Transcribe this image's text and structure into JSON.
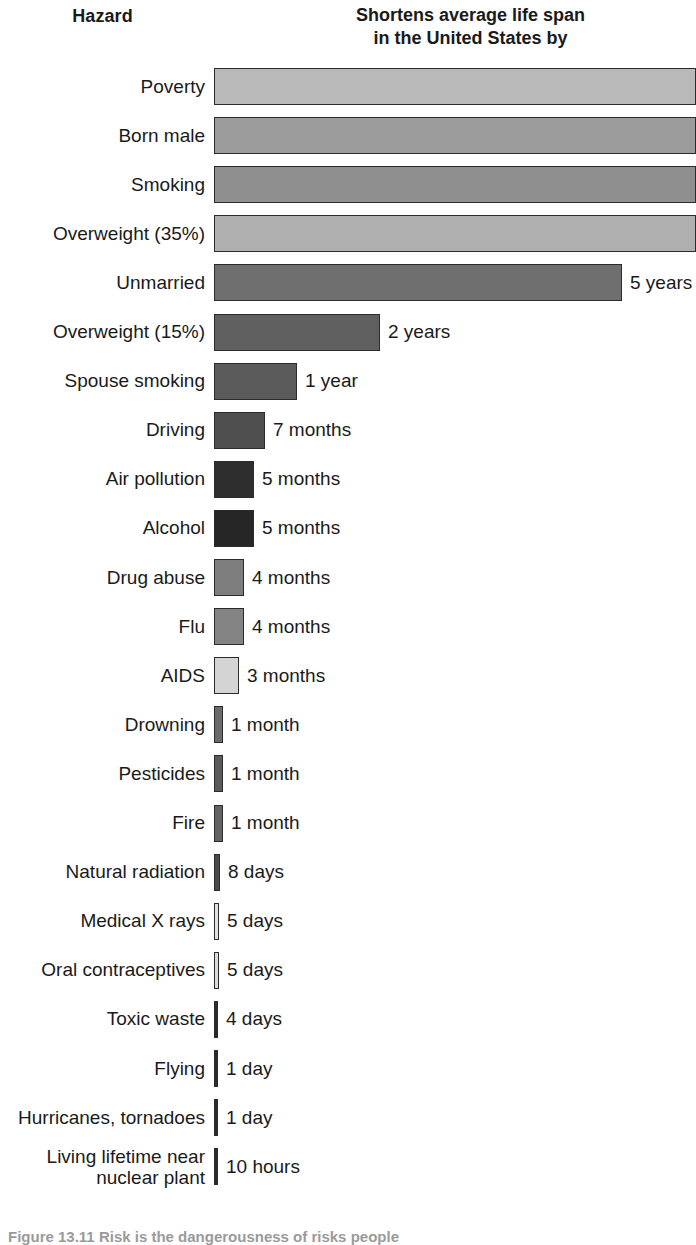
{
  "header": {
    "left_title": "Hazard",
    "right_title_line1": "Shortens average life span",
    "right_title_line2": "in the United States by"
  },
  "caption": "Figure 13.11  Risk is the dangerousness of risks people",
  "chart_data": {
    "type": "bar",
    "title": "Shortens average life span in the United States by",
    "xlabel": "",
    "ylabel": "Hazard",
    "orientation": "horizontal",
    "grid": false,
    "legend": "none",
    "note": "Top four bars extend past the right edge of the image (values not labeled).",
    "categories": [
      "Poverty",
      "Born male",
      "Smoking",
      "Overweight (35%)",
      "Unmarried",
      "Overweight (15%)",
      "Spouse smoking",
      "Driving",
      "Air pollution",
      "Alcohol",
      "Drug abuse",
      "Flu",
      "AIDS",
      "Drowning",
      "Pesticides",
      "Fire",
      "Natural radiation",
      "Medical X rays",
      "Oral contraceptives",
      "Toxic waste",
      "Flying",
      "Hurricanes, tornadoes",
      "Living lifetime near nuclear plant"
    ],
    "value_labels": [
      "",
      "",
      "",
      "",
      "5 years",
      "2 years",
      "1 year",
      "7 months",
      "5 months",
      "5 months",
      "4 months",
      "4 months",
      "3 months",
      "1 month",
      "1 month",
      "1 month",
      "8 days",
      "5 days",
      "5 days",
      "4 days",
      "1 day",
      "1 day",
      "10 hours"
    ],
    "values_days": [
      null,
      null,
      null,
      null,
      1825,
      730,
      365,
      213,
      152,
      152,
      122,
      122,
      91,
      30,
      30,
      30,
      8,
      5,
      5,
      4,
      1,
      1,
      0.42
    ],
    "bar_colors": [
      "#b9b9b9",
      "#9c9c9c",
      "#8f8f8f",
      "#b0b0b0",
      "#6f6f6f",
      "#5f5f5f",
      "#5a5a5a",
      "#4f4f4f",
      "#2e2e2e",
      "#262626",
      "#7e7e7e",
      "#848484",
      "#d4d4d4",
      "#6b6b6b",
      "#5a5a5a",
      "#636363",
      "#4a4a4a",
      "#e2e2e2",
      "#dcdcdc",
      "#2a2a2a",
      "#2a2a2a",
      "#2a2a2a",
      "#2a2a2a"
    ],
    "bar_pixel_widths": [
      482,
      482,
      482,
      482,
      408,
      166,
      83,
      51,
      40,
      40,
      30,
      30,
      25,
      9,
      9,
      9,
      6,
      5,
      5,
      4,
      4,
      4,
      4
    ]
  },
  "rows": [
    {
      "label": "Poverty",
      "value": "",
      "width": 482,
      "color": "#b9b9b9"
    },
    {
      "label": "Born male",
      "value": "",
      "width": 482,
      "color": "#9c9c9c"
    },
    {
      "label": "Smoking",
      "value": "",
      "width": 482,
      "color": "#8f8f8f"
    },
    {
      "label": "Overweight (35%)",
      "value": "",
      "width": 482,
      "color": "#b0b0b0"
    },
    {
      "label": "Unmarried",
      "value": "5 years",
      "width": 408,
      "color": "#6f6f6f"
    },
    {
      "label": "Overweight (15%)",
      "value": "2 years",
      "width": 166,
      "color": "#5f5f5f"
    },
    {
      "label": "Spouse smoking",
      "value": "1 year",
      "width": 83,
      "color": "#5a5a5a"
    },
    {
      "label": "Driving",
      "value": "7 months",
      "width": 51,
      "color": "#4f4f4f"
    },
    {
      "label": "Air pollution",
      "value": "5 months",
      "width": 40,
      "color": "#2e2e2e"
    },
    {
      "label": "Alcohol",
      "value": "5 months",
      "width": 40,
      "color": "#262626"
    },
    {
      "label": "Drug abuse",
      "value": "4 months",
      "width": 30,
      "color": "#7e7e7e"
    },
    {
      "label": "Flu",
      "value": "4 months",
      "width": 30,
      "color": "#848484"
    },
    {
      "label": "AIDS",
      "value": "3 months",
      "width": 25,
      "color": "#d4d4d4"
    },
    {
      "label": "Drowning",
      "value": "1 month",
      "width": 9,
      "color": "#6b6b6b"
    },
    {
      "label": "Pesticides",
      "value": "1 month",
      "width": 9,
      "color": "#5a5a5a"
    },
    {
      "label": "Fire",
      "value": "1 month",
      "width": 9,
      "color": "#636363"
    },
    {
      "label": "Natural radiation",
      "value": "8 days",
      "width": 6,
      "color": "#4a4a4a"
    },
    {
      "label": "Medical X rays",
      "value": "5 days",
      "width": 5,
      "color": "#e2e2e2"
    },
    {
      "label": "Oral contraceptives",
      "value": "5 days",
      "width": 5,
      "color": "#dcdcdc"
    },
    {
      "label": "Toxic waste",
      "value": "4 days",
      "width": 4,
      "color": "#2a2a2a"
    },
    {
      "label": "Flying",
      "value": "1 day",
      "width": 4,
      "color": "#2a2a2a"
    },
    {
      "label": "Hurricanes, tornadoes",
      "value": "1 day",
      "width": 4,
      "color": "#2a2a2a"
    },
    {
      "label": "Living lifetime near\nnuclear plant",
      "value": "10 hours",
      "width": 4,
      "color": "#2a2a2a"
    }
  ]
}
